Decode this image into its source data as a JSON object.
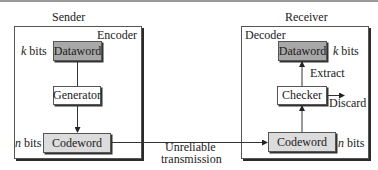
{
  "sender": {
    "title": "Sender",
    "panel_label": "Encoder",
    "dataword": {
      "label": "Dataword",
      "bits_prefix": "k",
      "bits_suffix": " bits"
    },
    "generator": {
      "label": "Generator"
    },
    "codeword": {
      "label": "Codeword",
      "bits_prefix": "n",
      "bits_suffix": " bits"
    }
  },
  "channel": {
    "line1": "Unreliable",
    "line2": "transmission"
  },
  "receiver": {
    "title": "Receiver",
    "panel_label": "Decoder",
    "dataword": {
      "label": "Dataword",
      "bits_prefix": "k",
      "bits_suffix": " bits"
    },
    "checker": {
      "label": "Checker"
    },
    "codeword": {
      "label": "Codeword",
      "bits_prefix": "n",
      "bits_suffix": " bits"
    },
    "extract_label": "Extract",
    "discard_label": "Discard"
  },
  "colors": {
    "dataword_fill": "#a8a8a8",
    "codeword_fill": "#dcdcdc",
    "generator_fill": "#ffffff",
    "outline": "#555555"
  }
}
